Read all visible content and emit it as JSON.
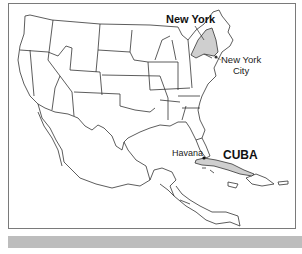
{
  "map": {
    "title": "",
    "region": "United States, Mexico, Central America and Caribbean",
    "labels": {
      "new_york": "New York",
      "new_york_city_line1": "New York",
      "new_york_city_line2": "City",
      "havana": "Havana",
      "cuba": "CUBA"
    },
    "highlighted_regions": [
      "New York",
      "Cuba"
    ],
    "highlight_color": "#cfcfcf",
    "outline_color": "#333333",
    "frame_color": "#7a7a7a",
    "bottom_bar_color": "#bdbdbd"
  }
}
